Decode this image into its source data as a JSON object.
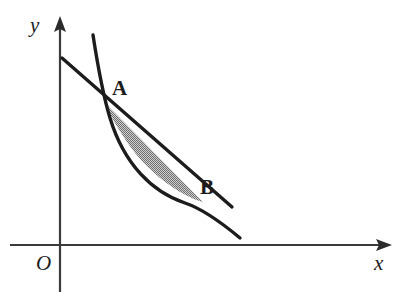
{
  "figure": {
    "background_color": "#ffffff",
    "width": 409,
    "height": 304
  },
  "axes": {
    "origin_label": "O",
    "x_axis_label": "x",
    "y_axis_label": "y",
    "axis_color": "#3a3a3a",
    "origin_px": {
      "x": 60,
      "y": 245
    },
    "x_axis_extent_px": {
      "x1": 10,
      "y1": 245,
      "x2": 392,
      "y2": 245
    },
    "y_axis_extent_px": {
      "x1": 60,
      "y1": 292,
      "x2": 60,
      "y2": 16
    },
    "x_label_px": {
      "x": 374,
      "y": 270
    },
    "y_label_px": {
      "x": 30,
      "y": 32
    },
    "origin_label_px": {
      "x": 36,
      "y": 270
    }
  },
  "points": [
    {
      "name": "A",
      "label": "A",
      "px": {
        "x": 105,
        "y": 103
      },
      "label_px": {
        "x": 112,
        "y": 95
      }
    },
    {
      "name": "B",
      "label": "B",
      "px": {
        "x": 203,
        "y": 202
      },
      "label_px": {
        "x": 200,
        "y": 194
      }
    }
  ],
  "curve": {
    "name": "convex-decreasing-curve",
    "stroke_color": "#1c1c1c",
    "stroke_width": 3.4,
    "path": "M 93 35 C 99 74 103 95 110 118 C 124 164 152 192 185 203 C 203 209 222 223 240 238",
    "start_px": {
      "x": 93,
      "y": 35
    },
    "end_px": {
      "x": 240,
      "y": 238
    }
  },
  "chord": {
    "name": "secant-line-through-A-and-B",
    "stroke_color": "#1c1c1c",
    "stroke_width": 3.4,
    "path": "M 62 58 L 232 207",
    "start_px": {
      "x": 62,
      "y": 58
    },
    "end_px": {
      "x": 232,
      "y": 207
    }
  },
  "shaded_region": {
    "name": "lens-region-between-chord-and-curve",
    "description": "Region bounded above by the straight line from A to B and below by the curve from A to B",
    "fill_style": "halftone-gray-dither",
    "fill_color": "#a0a0a0",
    "path": "M 105 103 L 203 202 C 180 196 147 172 127 142 C 117 127 110 115 105 103 Z"
  }
}
